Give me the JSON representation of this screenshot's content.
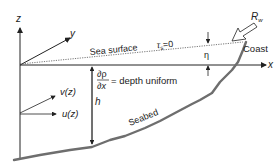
{
  "diagram": {
    "axes": {
      "z_label": "z",
      "y_label": "y",
      "x_label": "x"
    },
    "sea_surface": {
      "label": "Sea surface",
      "stress_symbol": "τ",
      "stress_subscript": "s",
      "stress_value": "=0"
    },
    "coast_label": "Coast",
    "wind": {
      "symbol": "R",
      "subscript": "w"
    },
    "eta_label": "η",
    "depth": {
      "h_label": "h",
      "grad_numerator": "∂ρ",
      "grad_denominator": "∂x",
      "grad_text": "= depth uniform"
    },
    "velocities": {
      "v_label": "v(z)",
      "u_label": "u(z)"
    },
    "seabed_label": "Seabed",
    "colors": {
      "line": "#222222",
      "seabed": "#6e6e6e",
      "surface_dotted": "#555555"
    }
  }
}
